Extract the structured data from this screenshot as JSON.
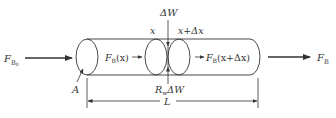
{
  "diagram": {
    "type": "free-body diagram of cylindrical element",
    "colors": {
      "stroke": "#333333",
      "background": "#ffffff"
    },
    "labels": {
      "input_force": {
        "main": "F",
        "sub": "B",
        "subsub": "0"
      },
      "output_force": {
        "main": "F",
        "sub": "B"
      },
      "area": "A",
      "load": "ΔW",
      "section_left": "x",
      "section_right": "x+Δx",
      "internal_force_left": {
        "main": "F",
        "sub": "B",
        "arg": "(x)"
      },
      "internal_force_right": {
        "main": "F",
        "sub": "B",
        "arg": "(x+Δx)"
      },
      "reaction": {
        "main": "R",
        "sub": "w",
        "rest": "ΔW"
      },
      "length": "L"
    }
  }
}
